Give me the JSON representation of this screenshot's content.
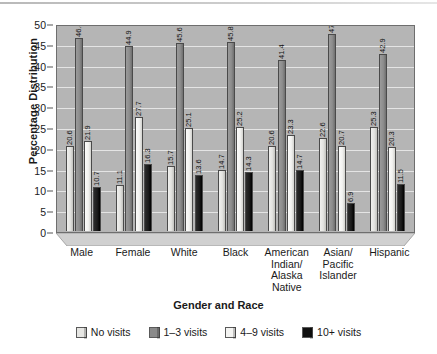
{
  "chart_data": {
    "type": "bar",
    "title": "",
    "xlabel": "Gender and Race",
    "ylabel": "Percentage Distribution",
    "ylim": [
      0,
      50
    ],
    "yticks": [
      0,
      5,
      10,
      15,
      20,
      25,
      30,
      35,
      40,
      45,
      50
    ],
    "grid": true,
    "legend_position": "bottom",
    "categories": [
      "Male",
      "Female",
      "White",
      "Black",
      "American Indian/ Alaska Native",
      "Asian/ Pacific Islander",
      "Hispanic"
    ],
    "category_lines": [
      [
        "Male"
      ],
      [
        "Female"
      ],
      [
        "White"
      ],
      [
        "Black"
      ],
      [
        "American",
        "Indian/",
        "Alaska",
        "Native"
      ],
      [
        "Asian/",
        "Pacific",
        "Islander"
      ],
      [
        "Hispanic"
      ]
    ],
    "series": [
      {
        "name": "No visits",
        "values": [
          20.6,
          11.1,
          15.7,
          14.7,
          20.6,
          22.6,
          25.3
        ]
      },
      {
        "name": "1–3 visits",
        "values": [
          46.8,
          44.9,
          45.6,
          45.8,
          41.4,
          47.8,
          42.9
        ]
      },
      {
        "name": "4–9 visits",
        "values": [
          21.9,
          27.7,
          25.1,
          25.2,
          23.3,
          20.7,
          20.3
        ]
      },
      {
        "name": "10+ visits",
        "values": [
          10.7,
          16.3,
          13.6,
          14.3,
          14.7,
          6.9,
          11.5
        ]
      }
    ],
    "colors": {
      "no_visits": "#e6e6e3",
      "visits_1_3": "#8a8a8a",
      "visits_4_9": "#f4f4f2",
      "visits_10_plus": "#111111",
      "plot_background": "#b5b5b5",
      "gridline": "#ececec"
    }
  }
}
